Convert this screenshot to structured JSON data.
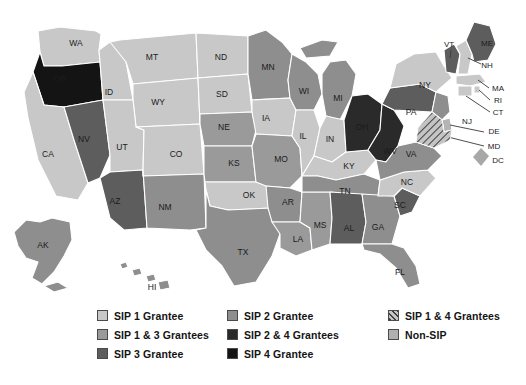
{
  "map": {
    "title": "US State SIP Grantee Status Map",
    "projection": "albers-usa",
    "background": "#ffffff",
    "border_color": "#ffffff",
    "dc_marker": {
      "label": "DC",
      "color": "#a8a8a8",
      "shape": "diamond"
    }
  },
  "categories": [
    {
      "key": "sip1",
      "label": "SIP 1 Grantee",
      "color": "#c8c8c8",
      "pattern": "solid"
    },
    {
      "key": "sip13",
      "label": "SIP 1 & 3 Grantees",
      "color": "#9a9a9a",
      "pattern": "solid"
    },
    {
      "key": "sip3",
      "label": "SIP 3 Grantee",
      "color": "#5d5d5d",
      "pattern": "solid"
    },
    {
      "key": "sip2",
      "label": "SIP 2 Grantee",
      "color": "#8e8e8e",
      "pattern": "solid"
    },
    {
      "key": "sip24",
      "label": "SIP 2 & 4 Grantees",
      "color": "#2a2a2a",
      "pattern": "solid"
    },
    {
      "key": "sip4",
      "label": "SIP 4 Grantee",
      "color": "#141414",
      "pattern": "solid"
    },
    {
      "key": "sip14",
      "label": "SIP 1 & 4 Grantees",
      "color": "#b4b4b4",
      "pattern": "diagonal-hatch"
    },
    {
      "key": "nonsip",
      "label": "Non-SIP",
      "color": "#b0b0b0",
      "pattern": "solid"
    }
  ],
  "legend": {
    "columns": [
      {
        "items": [
          "SIP 1 Grantee",
          "SIP 1 & 3 Grantees",
          "SIP 3 Grantee"
        ]
      },
      {
        "items": [
          "SIP 2 Grantee",
          "SIP 2 & 4 Grantees",
          "SIP 4 Grantee"
        ]
      },
      {
        "items": [
          "SIP 1 & 4 Grantees",
          "Non-SIP"
        ]
      }
    ]
  },
  "chart_data": {
    "type": "map",
    "value_field": "category",
    "states": [
      {
        "code": "WA",
        "category": "sip1",
        "color": "#c8c8c8"
      },
      {
        "code": "OR",
        "category": "sip4",
        "color": "#141414"
      },
      {
        "code": "CA",
        "category": "sip1",
        "color": "#c8c8c8"
      },
      {
        "code": "NV",
        "category": "sip3",
        "color": "#5d5d5d"
      },
      {
        "code": "ID",
        "category": "sip1",
        "color": "#c8c8c8"
      },
      {
        "code": "MT",
        "category": "sip1",
        "color": "#c8c8c8"
      },
      {
        "code": "WY",
        "category": "sip1",
        "color": "#c8c8c8"
      },
      {
        "code": "UT",
        "category": "sip1",
        "color": "#c8c8c8"
      },
      {
        "code": "AZ",
        "category": "sip3",
        "color": "#5d5d5d"
      },
      {
        "code": "CO",
        "category": "sip1",
        "color": "#c8c8c8"
      },
      {
        "code": "NM",
        "category": "sip2",
        "color": "#8e8e8e"
      },
      {
        "code": "ND",
        "category": "sip1",
        "color": "#c8c8c8"
      },
      {
        "code": "SD",
        "category": "sip1",
        "color": "#c8c8c8"
      },
      {
        "code": "NE",
        "category": "sip13",
        "color": "#9a9a9a"
      },
      {
        "code": "KS",
        "category": "sip13",
        "color": "#9a9a9a"
      },
      {
        "code": "OK",
        "category": "sip1",
        "color": "#c8c8c8"
      },
      {
        "code": "TX",
        "category": "sip2",
        "color": "#8e8e8e"
      },
      {
        "code": "MN",
        "category": "sip2",
        "color": "#8e8e8e"
      },
      {
        "code": "IA",
        "category": "sip1",
        "color": "#c8c8c8"
      },
      {
        "code": "MO",
        "category": "sip13",
        "color": "#9a9a9a"
      },
      {
        "code": "AR",
        "category": "sip2",
        "color": "#8e8e8e"
      },
      {
        "code": "LA",
        "category": "sip13",
        "color": "#9a9a9a"
      },
      {
        "code": "WI",
        "category": "sip2",
        "color": "#8e8e8e"
      },
      {
        "code": "IL",
        "category": "sip1",
        "color": "#c8c8c8"
      },
      {
        "code": "MS",
        "category": "sip13",
        "color": "#9a9a9a"
      },
      {
        "code": "MI",
        "category": "sip2",
        "color": "#8e8e8e"
      },
      {
        "code": "IN",
        "category": "sip1",
        "color": "#c8c8c8"
      },
      {
        "code": "KY",
        "category": "sip1",
        "color": "#c8c8c8"
      },
      {
        "code": "TN",
        "category": "sip2",
        "color": "#8e8e8e"
      },
      {
        "code": "AL",
        "category": "sip3",
        "color": "#5d5d5d"
      },
      {
        "code": "OH",
        "category": "sip24",
        "color": "#2a2a2a"
      },
      {
        "code": "WV",
        "category": "sip24",
        "color": "#2a2a2a"
      },
      {
        "code": "GA",
        "category": "sip2",
        "color": "#8e8e8e"
      },
      {
        "code": "FL",
        "category": "sip2",
        "color": "#8e8e8e"
      },
      {
        "code": "SC",
        "category": "sip3",
        "color": "#5d5d5d"
      },
      {
        "code": "NC",
        "category": "sip1",
        "color": "#c8c8c8"
      },
      {
        "code": "VA",
        "category": "sip2",
        "color": "#8e8e8e"
      },
      {
        "code": "MD",
        "category": "sip14",
        "color": "#b4b4b4"
      },
      {
        "code": "DE",
        "category": "sip14",
        "color": "#b4b4b4"
      },
      {
        "code": "PA",
        "category": "sip3",
        "color": "#5d5d5d"
      },
      {
        "code": "NJ",
        "category": "sip2",
        "color": "#8e8e8e"
      },
      {
        "code": "NY",
        "category": "sip1",
        "color": "#c8c8c8"
      },
      {
        "code": "CT",
        "category": "sip1",
        "color": "#c8c8c8"
      },
      {
        "code": "RI",
        "category": "sip1",
        "color": "#c8c8c8"
      },
      {
        "code": "MA",
        "category": "sip1",
        "color": "#c8c8c8"
      },
      {
        "code": "VT",
        "category": "sip3",
        "color": "#5d5d5d"
      },
      {
        "code": "NH",
        "category": "sip1",
        "color": "#c8c8c8"
      },
      {
        "code": "ME",
        "category": "sip3",
        "color": "#5d5d5d"
      },
      {
        "code": "AK",
        "category": "sip2",
        "color": "#8e8e8e"
      },
      {
        "code": "HI",
        "category": "sip2",
        "color": "#8e8e8e"
      },
      {
        "code": "DC",
        "category": "nonsip",
        "color": "#a8a8a8"
      }
    ]
  },
  "state_labels": [
    {
      "code": "WA",
      "x": 76,
      "y": 44
    },
    {
      "code": "OR",
      "x": 60,
      "y": 80
    },
    {
      "code": "CA",
      "x": 48,
      "y": 155
    },
    {
      "code": "NV",
      "x": 84,
      "y": 140
    },
    {
      "code": "ID",
      "x": 109,
      "y": 93
    },
    {
      "code": "MT",
      "x": 152,
      "y": 58
    },
    {
      "code": "WY",
      "x": 158,
      "y": 103
    },
    {
      "code": "UT",
      "x": 122,
      "y": 148
    },
    {
      "code": "AZ",
      "x": 115,
      "y": 202
    },
    {
      "code": "CO",
      "x": 176,
      "y": 155
    },
    {
      "code": "NM",
      "x": 165,
      "y": 208
    },
    {
      "code": "ND",
      "x": 221,
      "y": 58
    },
    {
      "code": "SD",
      "x": 222,
      "y": 95
    },
    {
      "code": "NE",
      "x": 224,
      "y": 128
    },
    {
      "code": "KS",
      "x": 234,
      "y": 164
    },
    {
      "code": "OK",
      "x": 249,
      "y": 196
    },
    {
      "code": "TX",
      "x": 243,
      "y": 253
    },
    {
      "code": "MN",
      "x": 268,
      "y": 68
    },
    {
      "code": "IA",
      "x": 266,
      "y": 119
    },
    {
      "code": "MO",
      "x": 281,
      "y": 160
    },
    {
      "code": "AR",
      "x": 288,
      "y": 203
    },
    {
      "code": "LA",
      "x": 298,
      "y": 240
    },
    {
      "code": "WI",
      "x": 304,
      "y": 92
    },
    {
      "code": "IL",
      "x": 303,
      "y": 137
    },
    {
      "code": "MS",
      "x": 320,
      "y": 226
    },
    {
      "code": "MI",
      "x": 338,
      "y": 99
    },
    {
      "code": "IN",
      "x": 330,
      "y": 140
    },
    {
      "code": "KY",
      "x": 349,
      "y": 167
    },
    {
      "code": "TN",
      "x": 345,
      "y": 192
    },
    {
      "code": "AL",
      "x": 349,
      "y": 229
    },
    {
      "code": "OH",
      "x": 362,
      "y": 128
    },
    {
      "code": "WV",
      "x": 390,
      "y": 152
    },
    {
      "code": "GA",
      "x": 378,
      "y": 228
    },
    {
      "code": "FL",
      "x": 400,
      "y": 273
    },
    {
      "code": "SC",
      "x": 400,
      "y": 206
    },
    {
      "code": "NC",
      "x": 407,
      "y": 183
    },
    {
      "code": "VA",
      "x": 411,
      "y": 155
    },
    {
      "code": "PA",
      "x": 411,
      "y": 113
    },
    {
      "code": "NY",
      "x": 425,
      "y": 86
    },
    {
      "code": "AK",
      "x": 43,
      "y": 246
    },
    {
      "code": "HI",
      "x": 152,
      "y": 288
    }
  ],
  "callout_labels": [
    {
      "code": "VT",
      "x": 449,
      "y": 45
    },
    {
      "code": "ME",
      "x": 487,
      "y": 44
    },
    {
      "code": "NH",
      "x": 487,
      "y": 66
    },
    {
      "code": "MA",
      "x": 498,
      "y": 89
    },
    {
      "code": "RI",
      "x": 498,
      "y": 101
    },
    {
      "code": "CT",
      "x": 498,
      "y": 113
    },
    {
      "code": "NJ",
      "x": 467,
      "y": 122
    },
    {
      "code": "DE",
      "x": 494,
      "y": 132
    },
    {
      "code": "MD",
      "x": 494,
      "y": 147
    },
    {
      "code": "DC",
      "x": 498,
      "y": 161
    }
  ]
}
